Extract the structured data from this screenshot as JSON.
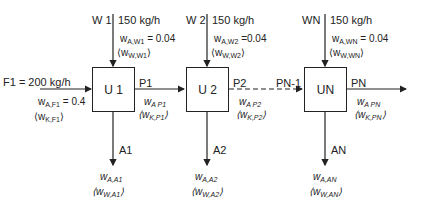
{
  "units": [
    {
      "id": "U 1",
      "water": "W 1",
      "water_flow": "150 kg/h",
      "water_wA": "0.04",
      "water_wA_sub": "A,W1",
      "water_wW_sub": "W,W1",
      "product": "P1",
      "product_wA_sub": "A P1",
      "product_wK_sub": "K,P1",
      "raffinate": "A1",
      "raffinate_wA_sub": "A,A1",
      "raffinate_wW_sub": "W,A1"
    },
    {
      "id": "U 2",
      "water": "W 2",
      "water_flow": "150 kg/h",
      "water_wA": "0.04",
      "water_wA_sub": "A,W2",
      "water_wW_sub": "W,W2",
      "product": "P2",
      "product_wA_sub": "A P2",
      "product_wK_sub": "K,P2",
      "raffinate": "A2",
      "raffinate_wA_sub": "A,A2",
      "raffinate_wW_sub": "W,A2"
    },
    {
      "id": "UN",
      "water": "WN",
      "water_flow": "150 kg/h",
      "water_wA": "0.04",
      "water_wA_sub": "A,WN",
      "water_wW_sub": "W,WN",
      "product": "PN",
      "product_wA_sub": "A PN",
      "product_wK_sub": "K,PN",
      "raffinate": "AN",
      "raffinate_wA_sub": "A,AN",
      "raffinate_wW_sub": "W,AN",
      "input": "PN-1"
    }
  ],
  "feed": {
    "label": "F1 = 200 kg/h",
    "wA_sub": "A,F1",
    "wA": "0.4",
    "wK_sub": "K,F1"
  },
  "symbols": {
    "w": "w",
    "eq": " = ",
    "lt": "⟨",
    "gt": "⟩"
  }
}
